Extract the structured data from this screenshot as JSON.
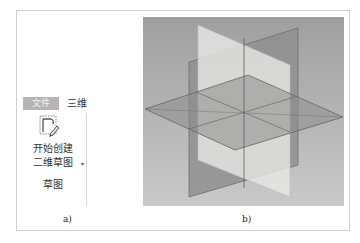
{
  "panel_a": {
    "tabs": [
      {
        "label": "文件",
        "active": true
      },
      {
        "label": "三维",
        "active": false
      }
    ],
    "button": {
      "icon": "sketch-pencil-icon",
      "label_line1": "开始创建",
      "label_line2": "二维草图",
      "dropdown_marker": "▾"
    },
    "group_label": "草图",
    "caption": "a)"
  },
  "panel_b": {
    "description": "origin planes view",
    "caption": "b)",
    "colors": {
      "background": "#a9a9a9",
      "light_plane": "#e4e4e2",
      "dark_plane": "#8e8e8e",
      "horizontal_plane": "#9c9c9c",
      "edge": "#6a6a6a"
    }
  }
}
